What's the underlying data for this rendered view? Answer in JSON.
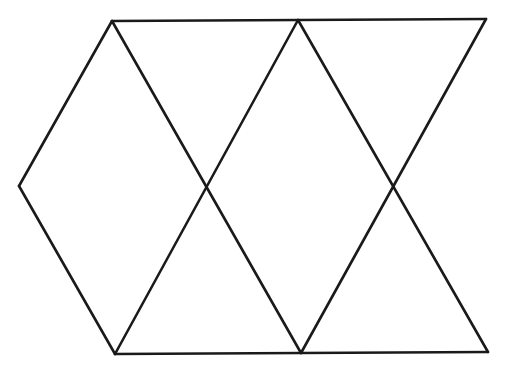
{
  "diagram": {
    "type": "geometric-figure",
    "stroke_color": "#1a1a1a",
    "stroke_width": 2.6,
    "background": "#ffffff",
    "vertices": {
      "top_left": [
        112,
        21
      ],
      "top_mid": [
        298,
        20
      ],
      "top_right": [
        486,
        19
      ],
      "mid_left": [
        19,
        186
      ],
      "mid_center": [
        206,
        186
      ],
      "mid_right": [
        394,
        185
      ],
      "bottom_left": [
        115,
        354
      ],
      "bottom_mid": [
        301,
        353
      ],
      "bottom_right": [
        488,
        352
      ]
    },
    "segments": [
      {
        "name": "top-edge",
        "from": [
          112,
          21
        ],
        "to": [
          486,
          19
        ]
      },
      {
        "name": "bottom-edge",
        "from": [
          115,
          354
        ],
        "to": [
          488,
          352
        ]
      },
      {
        "name": "left-upper-edge",
        "from": [
          112,
          21
        ],
        "to": [
          19,
          186
        ]
      },
      {
        "name": "left-lower-edge",
        "from": [
          19,
          186
        ],
        "to": [
          115,
          354
        ]
      },
      {
        "name": "diagonal-1-down",
        "from": [
          112,
          21
        ],
        "to": [
          301,
          353
        ]
      },
      {
        "name": "diagonal-2-up",
        "from": [
          115,
          354
        ],
        "to": [
          298,
          20
        ]
      },
      {
        "name": "diagonal-3-down",
        "from": [
          298,
          20
        ],
        "to": [
          488,
          352
        ]
      },
      {
        "name": "diagonal-4-up",
        "from": [
          301,
          353
        ],
        "to": [
          486,
          19
        ]
      }
    ]
  }
}
